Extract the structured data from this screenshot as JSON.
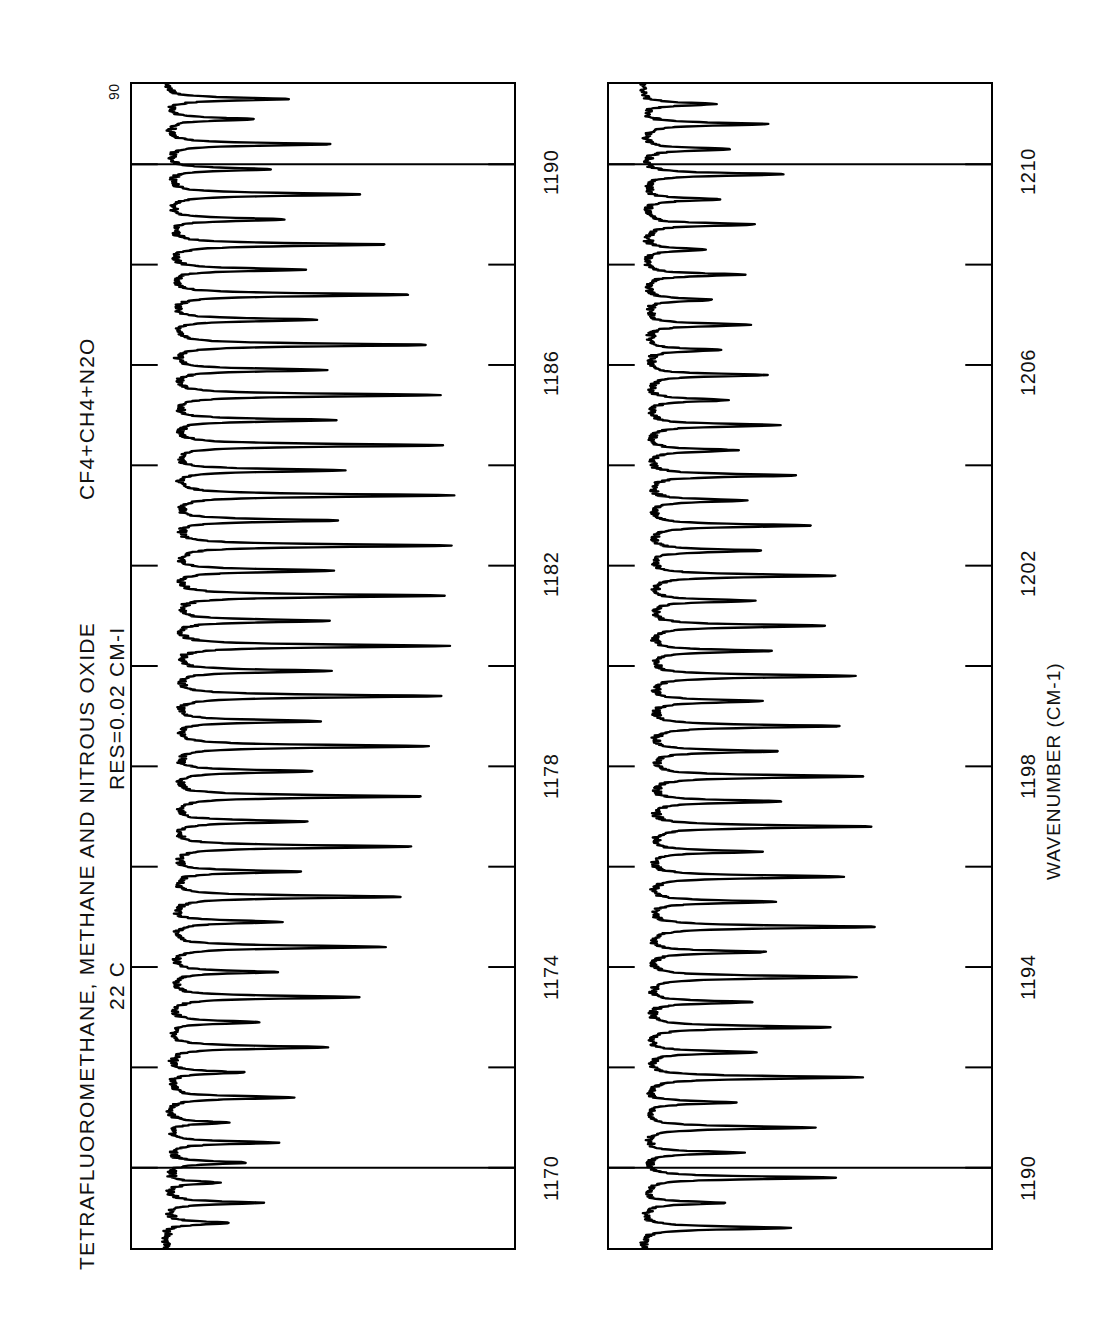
{
  "figure": {
    "title_line_1": "TETRAFLUOROMETHANE, METHANE AND NITROUS OXIDE",
    "title_formula": "CF4+CH4+N2O",
    "title_line_2_temperature": "22 C",
    "title_line_2_resolution": "RES=0.02 CM-I",
    "y_axis_top_label": "90",
    "x_axis_name": "WAVENUMBER (CM-1)",
    "background_color": "#ffffff",
    "trace_color": "#000000",
    "axis_color": "#000000"
  },
  "panels": [
    {
      "name": "upper-panel",
      "x_ticks": [
        "1170",
        "1174",
        "1178",
        "1182",
        "1186",
        "1190"
      ],
      "x_minor_between": 1,
      "gridlines": [
        "1170",
        "1190"
      ],
      "y_top_label": "90"
    },
    {
      "name": "lower-panel",
      "x_ticks": [
        "1190",
        "1194",
        "1198",
        "1202",
        "1206",
        "1210"
      ],
      "x_minor_between": 1,
      "gridlines": [
        "1190",
        "1210"
      ],
      "y_top_label": ""
    }
  ],
  "chart_data": {
    "type": "line",
    "title": "TETRAFLUOROMETHANE, METHANE AND NITROUS OXIDE   CF4+CH4+N2O",
    "subtitle": "22 C   RES=0.02 CM-I",
    "xlabel": "WAVENUMBER (CM-1)",
    "ylabel": "TRANSMITTANCE (%)",
    "orientation": "rotated-90-ccw",
    "grid": true,
    "legend": null,
    "ylim": [
      0,
      90
    ],
    "y_top_tick": 90,
    "panels": [
      {
        "id": "upper",
        "xlim": [
          1168.4,
          1191.6
        ],
        "xticks": [
          1170,
          1174,
          1178,
          1182,
          1186,
          1190
        ],
        "minor_tick_step": 2,
        "description": "Methane (CH4) nu4 band Q/R-branch comb of sharp absorption lines on a sloping CF4 continuum; regular ~1.0-1.1 cm-1 line spacing strengthening toward 1190.",
        "baseline_percent": 86,
        "lines": [
          {
            "x": 1168.9,
            "depth": 18
          },
          {
            "x": 1169.3,
            "depth": 26
          },
          {
            "x": 1169.7,
            "depth": 14
          },
          {
            "x": 1170.1,
            "depth": 22
          },
          {
            "x": 1170.5,
            "depth": 30
          },
          {
            "x": 1170.9,
            "depth": 16
          },
          {
            "x": 1171.4,
            "depth": 34
          },
          {
            "x": 1171.9,
            "depth": 20
          },
          {
            "x": 1172.4,
            "depth": 44
          },
          {
            "x": 1172.9,
            "depth": 24
          },
          {
            "x": 1173.4,
            "depth": 52
          },
          {
            "x": 1173.9,
            "depth": 28
          },
          {
            "x": 1174.4,
            "depth": 58
          },
          {
            "x": 1174.9,
            "depth": 30
          },
          {
            "x": 1175.4,
            "depth": 62
          },
          {
            "x": 1175.9,
            "depth": 34
          },
          {
            "x": 1176.4,
            "depth": 66
          },
          {
            "x": 1176.9,
            "depth": 36
          },
          {
            "x": 1177.4,
            "depth": 68
          },
          {
            "x": 1177.9,
            "depth": 38
          },
          {
            "x": 1178.4,
            "depth": 70
          },
          {
            "x": 1178.9,
            "depth": 40
          },
          {
            "x": 1179.4,
            "depth": 72
          },
          {
            "x": 1179.9,
            "depth": 42
          },
          {
            "x": 1180.4,
            "depth": 74
          },
          {
            "x": 1180.9,
            "depth": 42
          },
          {
            "x": 1181.4,
            "depth": 74
          },
          {
            "x": 1181.9,
            "depth": 44
          },
          {
            "x": 1182.4,
            "depth": 76
          },
          {
            "x": 1182.9,
            "depth": 44
          },
          {
            "x": 1183.4,
            "depth": 76
          },
          {
            "x": 1183.9,
            "depth": 46
          },
          {
            "x": 1184.4,
            "depth": 74
          },
          {
            "x": 1184.9,
            "depth": 44
          },
          {
            "x": 1185.4,
            "depth": 72
          },
          {
            "x": 1185.9,
            "depth": 42
          },
          {
            "x": 1186.4,
            "depth": 70
          },
          {
            "x": 1186.9,
            "depth": 40
          },
          {
            "x": 1187.4,
            "depth": 66
          },
          {
            "x": 1187.9,
            "depth": 36
          },
          {
            "x": 1188.4,
            "depth": 60
          },
          {
            "x": 1188.9,
            "depth": 32
          },
          {
            "x": 1189.4,
            "depth": 54
          },
          {
            "x": 1189.9,
            "depth": 28
          },
          {
            "x": 1190.4,
            "depth": 44
          },
          {
            "x": 1190.9,
            "depth": 24
          },
          {
            "x": 1191.3,
            "depth": 34
          }
        ]
      },
      {
        "id": "lower",
        "xlim": [
          1188.4,
          1211.6
        ],
        "xticks": [
          1190,
          1194,
          1198,
          1202,
          1206,
          1210
        ],
        "minor_tick_step": 2,
        "description": "Nitrous oxide (N2O) nu1 band with dense rotational structure; absorption line strength peaks near 1196-1204 then falls off toward 1210.",
        "baseline_percent": 86,
        "lines": [
          {
            "x": 1188.8,
            "depth": 40
          },
          {
            "x": 1189.3,
            "depth": 22
          },
          {
            "x": 1189.8,
            "depth": 52
          },
          {
            "x": 1190.3,
            "depth": 26
          },
          {
            "x": 1190.8,
            "depth": 46
          },
          {
            "x": 1191.3,
            "depth": 24
          },
          {
            "x": 1191.8,
            "depth": 58
          },
          {
            "x": 1192.3,
            "depth": 30
          },
          {
            "x": 1192.8,
            "depth": 50
          },
          {
            "x": 1193.3,
            "depth": 28
          },
          {
            "x": 1193.8,
            "depth": 56
          },
          {
            "x": 1194.3,
            "depth": 32
          },
          {
            "x": 1194.8,
            "depth": 62
          },
          {
            "x": 1195.3,
            "depth": 34
          },
          {
            "x": 1195.8,
            "depth": 54
          },
          {
            "x": 1196.3,
            "depth": 30
          },
          {
            "x": 1196.8,
            "depth": 60
          },
          {
            "x": 1197.3,
            "depth": 36
          },
          {
            "x": 1197.8,
            "depth": 58
          },
          {
            "x": 1198.3,
            "depth": 34
          },
          {
            "x": 1198.8,
            "depth": 52
          },
          {
            "x": 1199.3,
            "depth": 30
          },
          {
            "x": 1199.8,
            "depth": 56
          },
          {
            "x": 1200.3,
            "depth": 32
          },
          {
            "x": 1200.8,
            "depth": 48
          },
          {
            "x": 1201.3,
            "depth": 28
          },
          {
            "x": 1201.8,
            "depth": 50
          },
          {
            "x": 1202.3,
            "depth": 30
          },
          {
            "x": 1202.8,
            "depth": 44
          },
          {
            "x": 1203.3,
            "depth": 26
          },
          {
            "x": 1203.8,
            "depth": 40
          },
          {
            "x": 1204.3,
            "depth": 24
          },
          {
            "x": 1204.8,
            "depth": 36
          },
          {
            "x": 1205.3,
            "depth": 22
          },
          {
            "x": 1205.8,
            "depth": 32
          },
          {
            "x": 1206.3,
            "depth": 20
          },
          {
            "x": 1206.8,
            "depth": 28
          },
          {
            "x": 1207.3,
            "depth": 18
          },
          {
            "x": 1207.8,
            "depth": 26
          },
          {
            "x": 1208.3,
            "depth": 16
          },
          {
            "x": 1208.8,
            "depth": 30
          },
          {
            "x": 1209.3,
            "depth": 20
          },
          {
            "x": 1209.8,
            "depth": 38
          },
          {
            "x": 1210.3,
            "depth": 24
          },
          {
            "x": 1210.8,
            "depth": 34
          },
          {
            "x": 1211.2,
            "depth": 20
          }
        ]
      }
    ]
  }
}
